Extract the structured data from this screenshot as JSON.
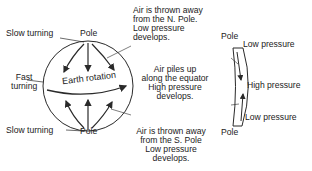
{
  "globe": {
    "north_left_label": "Slow turning",
    "north_pole": "Pole",
    "middle_left_label": [
      "Fast",
      "turning"
    ],
    "rotation_label": "Earth rotation",
    "south_left_label": "Slow turning",
    "south_pole": "Pole"
  },
  "annotations": {
    "north": [
      "Air is thrown away",
      "from the N. Pole.",
      "Low pressure",
      "develops."
    ],
    "equator": [
      "Air piles up",
      "along the equator",
      "High pressure",
      "develops."
    ],
    "south": [
      "Air is thrown away",
      "from the S. Pole",
      "Low pressure",
      "develops."
    ]
  },
  "cross_section": {
    "top_pole": "Pole",
    "bottom_pole": "Pole",
    "top_label": "Low pressure",
    "middle_label": "High pressure",
    "bottom_label": "Low pressure"
  },
  "colors": {
    "ink": "#2a2a2a",
    "background": "#ffffff"
  }
}
